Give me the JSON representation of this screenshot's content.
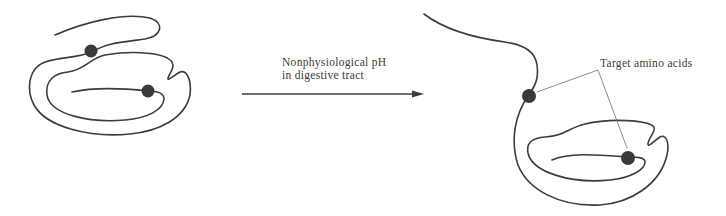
{
  "arrow": {
    "label_line1": "Nonphysiological pH",
    "label_line2": "in digestive tract"
  },
  "callout": {
    "label": "Target amino acids"
  },
  "colors": {
    "strand": "#3c3c3c",
    "dot": "#3a3a3a",
    "leader": "#707070"
  },
  "states": [
    {
      "name": "folded-protein",
      "target_sites": 2
    },
    {
      "name": "partially-unfolded-protein",
      "target_sites": 2
    }
  ]
}
